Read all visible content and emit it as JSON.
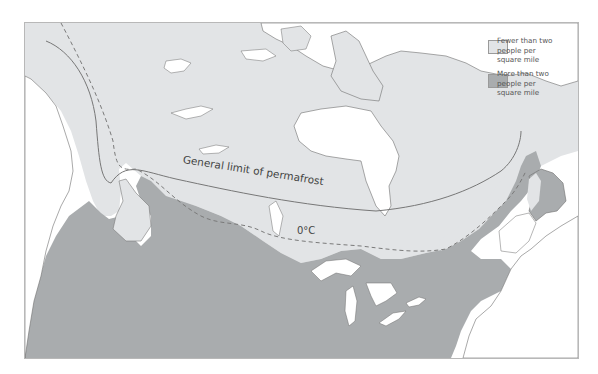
{
  "map": {
    "colors": {
      "sparse": "#e2e4e6",
      "dense": "#a9acae",
      "water": "#ffffff",
      "outline": "#6e6e6e",
      "permafrost_line": "#777777",
      "isotherm_line": "#7a7a7a"
    },
    "labels": {
      "permafrost": "General limit of permafrost",
      "isotherm": "0°C"
    }
  },
  "legend": {
    "items": [
      {
        "label": "Fewer than two\npeople per\nsquare mile",
        "color": "#e2e4e6",
        "key": "sparse"
      },
      {
        "label": "More than two\npeople per\nsquare mile",
        "color": "#a9acae",
        "key": "dense"
      }
    ]
  }
}
